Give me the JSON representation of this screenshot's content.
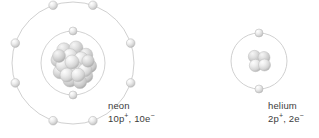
{
  "figure": {
    "background_color": "#ffffff",
    "width": 319,
    "height": 138
  },
  "palette": {
    "ring_stroke": "#c4c4c4",
    "electron_fill_light": "#ffffff",
    "electron_fill_mid": "#e3e3e3",
    "electron_fill_dark": "#b4b4b4",
    "electron_stroke": "#bdbdbd",
    "nucleon_fill_light": "#f4f4f4",
    "nucleon_fill_mid": "#dcdcdc",
    "nucleon_fill_dark": "#a9a9a9",
    "nucleon_stroke": "#b8b8b8",
    "text_color": "#3c3c3c"
  },
  "atoms": [
    {
      "id": "neon",
      "name_label": "neon",
      "composition_label": "10p+, 10e-",
      "composition_parts": {
        "proton_count": "10",
        "proton_symbol": "p",
        "proton_charge": "+",
        "separator": ", ",
        "electron_count": "10",
        "electron_symbol": "e",
        "electron_charge": "−"
      },
      "protons": 10,
      "electrons": 10,
      "nucleus": {
        "center_x": 73,
        "center_y": 63,
        "radius": 23,
        "nucleon_count": 19
      },
      "shells": [
        {
          "shell_index": 1,
          "radius": 32,
          "electron_count": 2,
          "electron_angles_deg": [
            270,
            90
          ]
        },
        {
          "shell_index": 2,
          "radius": 61,
          "electron_count": 8,
          "electron_angles_deg": [
            251,
            289,
            341,
            19,
            71,
            109,
            161,
            199
          ]
        }
      ],
      "label_position": {
        "x": 108,
        "y": 100
      }
    },
    {
      "id": "helium",
      "name_label": "helium",
      "composition_label": "2p+, 2e-",
      "composition_parts": {
        "proton_count": "2",
        "proton_symbol": "p",
        "proton_charge": "+",
        "separator": ", ",
        "electron_count": "2",
        "electron_symbol": "e",
        "electron_charge": "−"
      },
      "protons": 2,
      "electrons": 2,
      "nucleus": {
        "center_x": 259,
        "center_y": 61,
        "radius": 11,
        "nucleon_count": 4
      },
      "shells": [
        {
          "shell_index": 1,
          "radius": 28,
          "electron_count": 2,
          "electron_angles_deg": [
            270,
            90
          ]
        }
      ],
      "label_position": {
        "x": 268,
        "y": 100
      }
    }
  ]
}
